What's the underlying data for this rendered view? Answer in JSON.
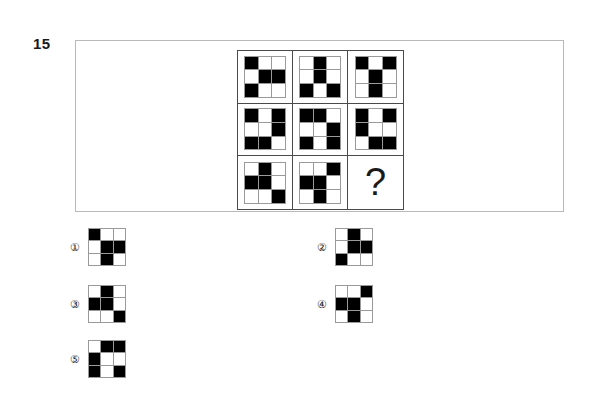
{
  "question": {
    "number": "15",
    "missing_marker": "?"
  },
  "colors": {
    "cell_on": "#000000",
    "cell_off": "#ffffff",
    "tile_gridline": "#9a9a9a",
    "matrix_border": "#4a4a4a",
    "frame_border": "#b9b9b9",
    "text": "#1a1a1a"
  },
  "matrix": {
    "rows": 3,
    "cols": 3,
    "tile_rows": 3,
    "tile_cols": 3,
    "cells": [
      {
        "position": "r1c1",
        "filled": [
          0,
          4,
          5,
          6
        ]
      },
      {
        "position": "r1c2",
        "filled": [
          1,
          4,
          6,
          8
        ]
      },
      {
        "position": "r1c3",
        "filled": [
          0,
          2,
          4,
          7
        ]
      },
      {
        "position": "r2c1",
        "filled": [
          0,
          2,
          5,
          6,
          7
        ]
      },
      {
        "position": "r2c2",
        "filled": [
          0,
          1,
          5,
          6,
          8
        ]
      },
      {
        "position": "r2c3",
        "filled": [
          0,
          2,
          3,
          7,
          8
        ]
      },
      {
        "position": "r3c1",
        "filled": [
          1,
          3,
          4,
          8
        ]
      },
      {
        "position": "r3c2",
        "filled": [
          2,
          3,
          4,
          7
        ]
      },
      {
        "position": "r3c3",
        "filled": [],
        "is_question": true
      }
    ]
  },
  "options": [
    {
      "label": "①",
      "number": "1",
      "filled": [
        0,
        4,
        5,
        7
      ]
    },
    {
      "label": "②",
      "number": "2",
      "filled": [
        1,
        4,
        5,
        6
      ]
    },
    {
      "label": "③",
      "number": "3",
      "filled": [
        1,
        3,
        4,
        8
      ]
    },
    {
      "label": "④",
      "number": "4",
      "filled": [
        2,
        3,
        4,
        7
      ]
    },
    {
      "label": "⑤",
      "number": "5",
      "filled": [
        1,
        2,
        3,
        6,
        8
      ]
    }
  ]
}
